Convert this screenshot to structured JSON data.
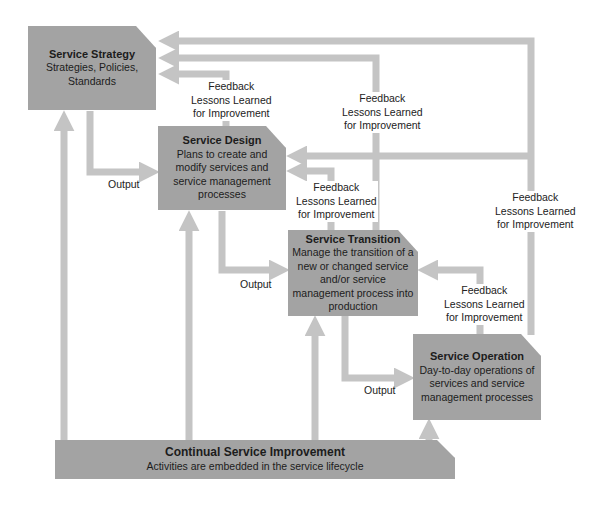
{
  "diagram": {
    "boxes": {
      "strategy": {
        "title": "Service Strategy",
        "desc": "Strategies, Policies, Standards"
      },
      "design": {
        "title": "Service Design",
        "desc": "Plans to create and modify services and service management processes"
      },
      "transition": {
        "title": "Service Transition",
        "desc": "Manage the transition of a new or changed service and/or service management process into production"
      },
      "operation": {
        "title": "Service Operation",
        "desc": "Day-to-day operations of services and service management processes"
      },
      "csi": {
        "title": "Continual Service Improvement",
        "desc": "Activities are embedded in the service lifecycle"
      }
    },
    "feedback_labels": [
      {
        "line1": "Feedback",
        "line2": "Lessons Learned",
        "line3": "for Improvement"
      },
      {
        "line1": "Feedback",
        "line2": "Lessons Learned",
        "line3": "for Improvement"
      },
      {
        "line1": "Feedback",
        "line2": "Lessons Learned",
        "line3": "for Improvement"
      },
      {
        "line1": "Feedback",
        "line2": "Lessons Learned",
        "line3": "for Improvement"
      },
      {
        "line1": "Feedback",
        "line2": "Lessons Learned",
        "line3": "for Improvement"
      }
    ],
    "output_labels": [
      "Output",
      "Output",
      "Output"
    ],
    "colors": {
      "box": "#a3a3a3",
      "arrow": "#c4c4c4",
      "background": "#ffffff"
    }
  }
}
